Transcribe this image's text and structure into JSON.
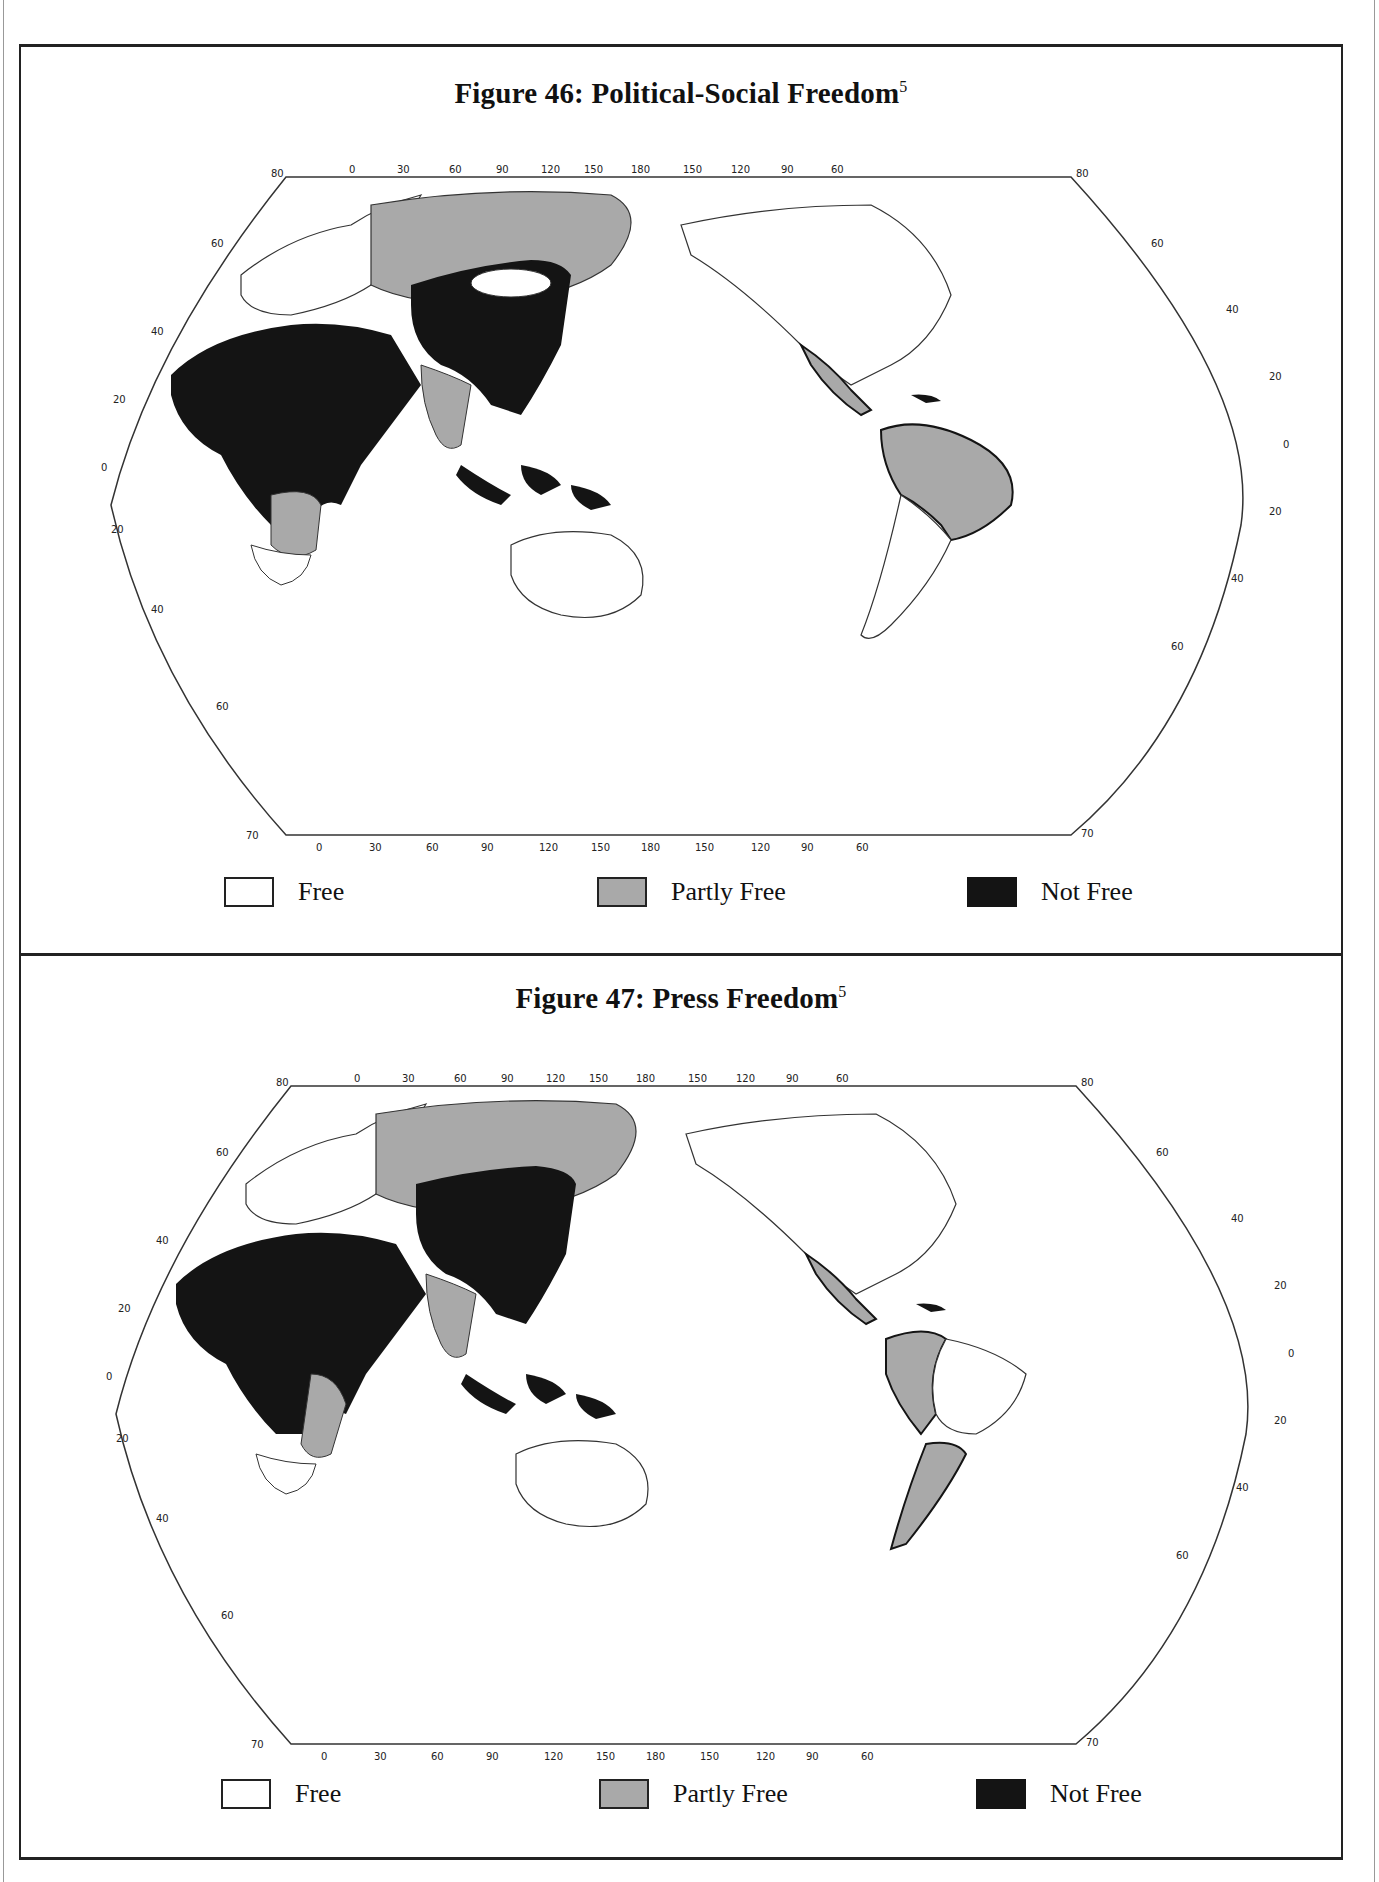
{
  "page": {
    "header_fragment": "...graphy"
  },
  "legend_colors": {
    "free": "#ffffff",
    "partly_free": "#a9a9a9",
    "not_free": "#141414"
  },
  "figures": [
    {
      "number": "46",
      "title": "Figure 46:  Political-Social Freedom",
      "footnote": "5",
      "legend": [
        {
          "key": "free",
          "label": "Free"
        },
        {
          "key": "partly_free",
          "label": "Partly Free"
        },
        {
          "key": "not_free",
          "label": "Not Free"
        }
      ],
      "top_longitude_ticks": [
        "0",
        "30",
        "60",
        "90",
        "120",
        "150",
        "180",
        "150",
        "120",
        "90",
        "60"
      ],
      "bottom_longitude_ticks": [
        "0",
        "30",
        "60",
        "90",
        "120",
        "150",
        "180",
        "150",
        "120",
        "90",
        "60"
      ],
      "left_latitude_ticks": [
        "80",
        "60",
        "40",
        "20",
        "0",
        "20",
        "40",
        "60",
        "70"
      ],
      "right_latitude_ticks": [
        "80",
        "60",
        "40",
        "20",
        "0",
        "20",
        "40",
        "60",
        "70"
      ],
      "regions": {
        "not_free": [
          "China",
          "Mongolia border region",
          "Middle East",
          "North Africa",
          "Central Africa",
          "Indonesia",
          "Southeast Asia",
          "Eastern Europe",
          "Cuba"
        ],
        "partly_free": [
          "USSR",
          "India",
          "Mexico",
          "Brazil and northern South America",
          "Southern Africa",
          "Madagascar",
          "Papua New Guinea"
        ],
        "free": [
          "North America",
          "Western Europe",
          "Australia",
          "Japan",
          "Southern South America",
          "South Africa",
          "Mongolia"
        ]
      }
    },
    {
      "number": "47",
      "title": "Figure 47:  Press Freedom",
      "footnote": "5",
      "legend": [
        {
          "key": "free",
          "label": "Free"
        },
        {
          "key": "partly_free",
          "label": "Partly Free"
        },
        {
          "key": "not_free",
          "label": "Not Free"
        }
      ],
      "top_longitude_ticks": [
        "0",
        "30",
        "60",
        "90",
        "120",
        "150",
        "180",
        "150",
        "120",
        "90",
        "60"
      ],
      "bottom_longitude_ticks": [
        "0",
        "30",
        "60",
        "90",
        "120",
        "150",
        "180",
        "150",
        "120",
        "90",
        "60"
      ],
      "left_latitude_ticks": [
        "80",
        "60",
        "40",
        "20",
        "0",
        "20",
        "40",
        "60",
        "70"
      ],
      "right_latitude_ticks": [
        "80",
        "60",
        "40",
        "20",
        "0",
        "20",
        "40",
        "60",
        "70"
      ],
      "regions": {
        "not_free": [
          "China",
          "Mongolia",
          "Middle East",
          "North Africa",
          "Central Africa",
          "Indonesia",
          "Southeast Asia",
          "Cuba"
        ],
        "partly_free": [
          "USSR",
          "India",
          "Mexico",
          "Western South America",
          "Argentina",
          "Southern Africa",
          "Madagascar"
        ],
        "free": [
          "North America",
          "Western Europe",
          "Australia",
          "Japan",
          "Brazil",
          "South Africa"
        ]
      }
    }
  ]
}
